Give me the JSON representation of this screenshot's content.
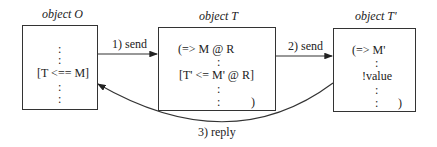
{
  "objects": {
    "o": {
      "title": "object O",
      "lines": [
        ":",
        ":",
        "[T <== M]",
        ":",
        ":"
      ]
    },
    "t": {
      "title": "object T",
      "lines": [
        "(=> M @ R",
        ":",
        "[T' <= M' @ R]",
        ":",
        ":",
        ")"
      ]
    },
    "tp": {
      "title": "object T'",
      "lines": [
        "(=> M'",
        ":",
        "!value",
        ":",
        ":",
        ")"
      ]
    }
  },
  "arrows": {
    "send1": "1) send",
    "send2": "2) send",
    "reply": "3) reply"
  }
}
